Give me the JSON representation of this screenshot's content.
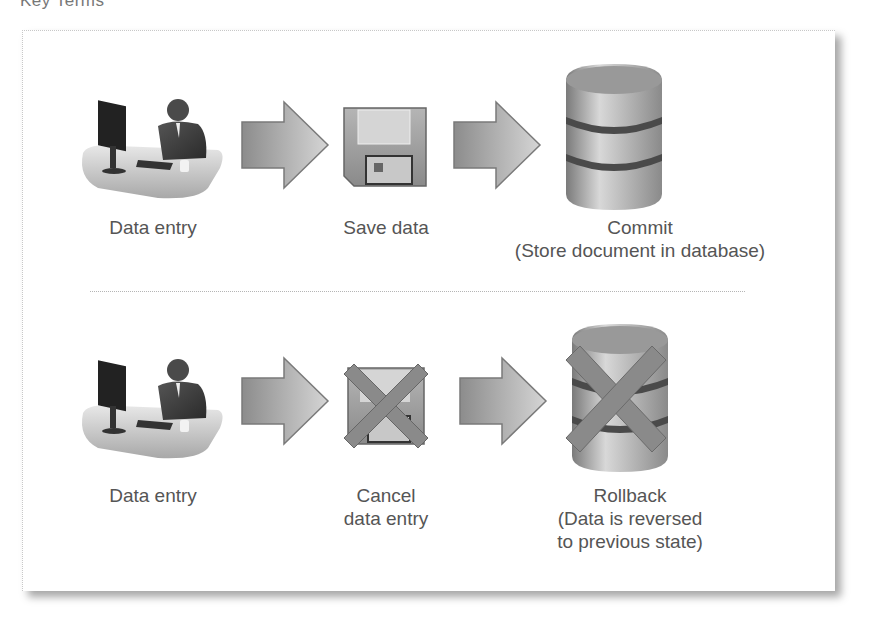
{
  "title_cutoff": "Key Terms",
  "diagram": {
    "rows": [
      {
        "name": "commit-flow",
        "steps": [
          {
            "icon": "person-at-computer-icon",
            "label": [
              "Data entry"
            ]
          },
          {
            "icon": "arrow-right-icon"
          },
          {
            "icon": "floppy-disk-icon",
            "label": [
              "Save data"
            ]
          },
          {
            "icon": "arrow-right-icon"
          },
          {
            "icon": "database-icon",
            "label": [
              "Commit",
              "(Store document in database)"
            ]
          }
        ]
      },
      {
        "name": "rollback-flow",
        "steps": [
          {
            "icon": "person-at-computer-icon",
            "label": [
              "Data entry"
            ]
          },
          {
            "icon": "arrow-right-icon"
          },
          {
            "icon": "floppy-disk-crossed-icon",
            "label": [
              "Cancel",
              "data entry"
            ]
          },
          {
            "icon": "arrow-right-icon"
          },
          {
            "icon": "database-crossed-icon",
            "label": [
              "Rollback",
              "(Data is reversed",
              "to previous state)"
            ]
          }
        ]
      }
    ]
  },
  "colors": {
    "text": "#555555",
    "icon_gray": "#9a9a9a",
    "cross": "#8a8a8a",
    "frame_shadow": "#999999"
  }
}
